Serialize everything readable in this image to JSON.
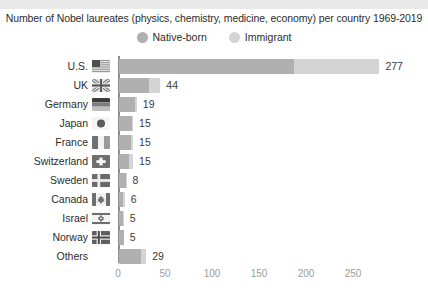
{
  "chart_data": {
    "type": "bar",
    "orientation": "horizontal",
    "stacked": true,
    "title": "Number of Nobel laureates (physics, chemistry, medicine, economy) per country 1969-2019",
    "xlabel": "",
    "ylabel": "",
    "xlim": [
      0,
      290
    ],
    "xticks": [
      0,
      50,
      100,
      150,
      200,
      250
    ],
    "xtick_labels": [
      "0",
      "50",
      "100",
      "150",
      "200",
      "250"
    ],
    "grid": false,
    "legend_position": "top-center",
    "legend": [
      {
        "name": "Native-born",
        "color": "#b0b0b0"
      },
      {
        "name": "Immigrant",
        "color": "#d4d4d4"
      }
    ],
    "categories": [
      "U.S.",
      "UK",
      "Germany",
      "Japan",
      "France",
      "Switzerland",
      "Sweden",
      "Canada",
      "Israel",
      "Norway",
      "Others"
    ],
    "series": [
      {
        "name": "Native-born",
        "values": [
          186,
          32,
          17,
          14,
          13,
          11,
          7,
          4,
          4,
          5,
          23
        ]
      },
      {
        "name": "Immigrant",
        "values": [
          91,
          12,
          2,
          1,
          2,
          4,
          1,
          2,
          1,
          0,
          6
        ]
      }
    ],
    "totals": [
      277,
      44,
      19,
      15,
      15,
      15,
      8,
      6,
      5,
      5,
      29
    ],
    "total_labels": [
      "277",
      "44",
      "19",
      "15",
      "15",
      "15",
      "8",
      "6",
      "5",
      "5",
      "29"
    ],
    "flags": [
      "us-flag-icon",
      "uk-flag-icon",
      "germany-flag-icon",
      "japan-flag-icon",
      "france-flag-icon",
      "switzerland-flag-icon",
      "sweden-flag-icon",
      "canada-flag-icon",
      "israel-flag-icon",
      "norway-flag-icon",
      null
    ]
  },
  "colors": {
    "native": "#b0b0b0",
    "immigrant": "#d4d4d4",
    "axis": "#8e8e8e",
    "tick_text": "#9b9b9b",
    "label_text": "#2c2c2c",
    "value_text": "#3a3a3a",
    "background": "#ffffff",
    "top_band": "#e9e9e9"
  }
}
